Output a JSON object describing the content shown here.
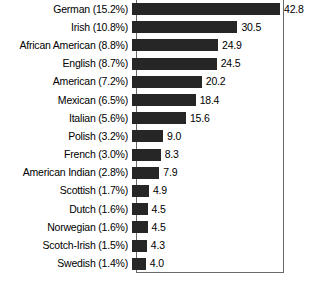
{
  "chart_data": {
    "type": "bar",
    "orientation": "horizontal",
    "title": "",
    "subtitle": "",
    "xlabel": "",
    "ylabel": "",
    "grid": false,
    "legend": null,
    "axis_ticks_visible": false,
    "xlim": [
      0,
      42.8
    ],
    "value_label_format": "one-decimal",
    "categories": [
      "German (15.2%)",
      "Irish (10.8%)",
      "African American (8.8%)",
      "English (8.7%)",
      "American (7.2%)",
      "Mexican (6.5%)",
      "Italian (5.6%)",
      "Polish (3.2%)",
      "French (3.0%)",
      "American Indian (2.8%)",
      "Scottish (1.7%)",
      "Dutch (1.6%)",
      "Norwegian (1.6%)",
      "Scotch-Irish (1.5%)",
      "Swedish (1.4%)"
    ],
    "values": [
      42.8,
      30.5,
      24.9,
      24.5,
      20.2,
      18.4,
      15.6,
      9.0,
      8.3,
      7.9,
      4.9,
      4.5,
      4.5,
      4.3,
      4.0
    ],
    "value_labels": [
      "42.8",
      "30.5",
      "24.9",
      "24.5",
      "20.2",
      "18.4",
      "15.6",
      "9.0",
      "8.3",
      "7.9",
      "4.9",
      "4.5",
      "4.5",
      "4.3",
      "4.0"
    ],
    "percent_labels": [
      "15.2%",
      "10.8%",
      "8.8%",
      "8.7%",
      "7.2%",
      "6.5%",
      "5.6%",
      "3.2%",
      "3.0%",
      "2.8%",
      "1.7%",
      "1.6%",
      "1.6%",
      "1.5%",
      "1.4%"
    ],
    "group_names": [
      "German",
      "Irish",
      "African American",
      "English",
      "American",
      "Mexican",
      "Italian",
      "Polish",
      "French",
      "American Indian",
      "Scottish",
      "Dutch",
      "Norwegian",
      "Scotch-Irish",
      "Swedish"
    ],
    "colors": {
      "bar": "#262626",
      "frame": "#6a6a6a",
      "background": "#ffffff",
      "text": "#000000"
    }
  }
}
